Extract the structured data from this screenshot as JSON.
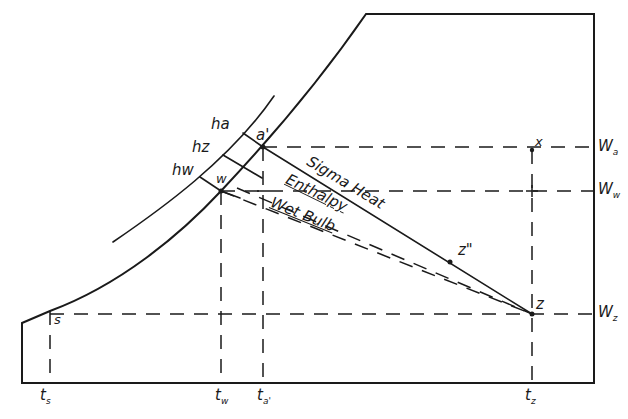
{
  "diagram": {
    "title": "",
    "type": "psychrometric-chart-schematic",
    "colors": {
      "ink": "#1a1a1a",
      "background": "#ffffff"
    },
    "enthalpy_scale": {
      "labels": [
        {
          "id": "ha",
          "main": "h",
          "sub": "a"
        },
        {
          "id": "hz",
          "main": "h",
          "sub": "z"
        },
        {
          "id": "hw",
          "main": "h",
          "sub": "w"
        }
      ]
    },
    "points": {
      "a_prime": "a'",
      "w": "w",
      "x": "x",
      "z_double_prime": "z\"",
      "z": "z",
      "s": "s"
    },
    "lines": {
      "sigma_heat": "Sigma Heat",
      "enthalpy": "Enthalpy",
      "wet_bulb": "Wet Bulb"
    },
    "humidity_axis": {
      "labels": [
        {
          "id": "Wa",
          "main": "W",
          "sub": "a"
        },
        {
          "id": "Ww",
          "main": "W",
          "sub": "w"
        },
        {
          "id": "Wz",
          "main": "W",
          "sub": "z"
        }
      ]
    },
    "temperature_axis": {
      "labels": [
        {
          "id": "ts",
          "main": "t",
          "sub": "s"
        },
        {
          "id": "tw",
          "main": "t",
          "sub": "w"
        },
        {
          "id": "ta_prime",
          "main": "t",
          "sub": "a'"
        },
        {
          "id": "tz",
          "main": "t",
          "sub": "z"
        }
      ]
    }
  }
}
